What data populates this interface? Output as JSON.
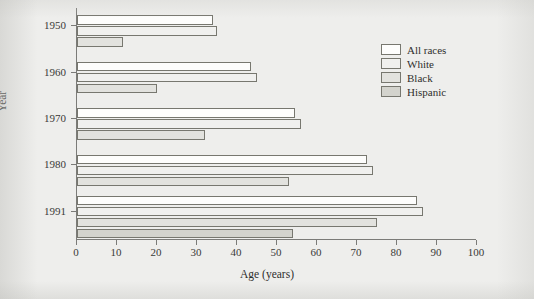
{
  "chart_data": {
    "type": "bar",
    "orientation": "horizontal",
    "title": "",
    "xlabel": "Age (years)",
    "ylabel": "Year",
    "xlim": [
      0,
      100
    ],
    "xticks": [
      0,
      10,
      20,
      30,
      40,
      50,
      60,
      70,
      80,
      90,
      100
    ],
    "xticklabels": [
      "0",
      "10",
      "20",
      "30",
      "40",
      "50",
      "60",
      "70",
      "80",
      "90",
      "100"
    ],
    "categories": [
      "1950",
      "1960",
      "1970",
      "1980",
      "1991"
    ],
    "yticklabels": [
      "1950",
      "1960",
      "1970",
      "1980",
      "1991"
    ],
    "grid": false,
    "legend_position": "upper right",
    "series": [
      {
        "name": "All races",
        "color": "#fdfdfc",
        "values": [
          34,
          43.5,
          54.5,
          72.5,
          85
        ]
      },
      {
        "name": "White",
        "color": "#f0f0ee",
        "values": [
          35,
          45,
          56,
          74,
          86.5
        ]
      },
      {
        "name": "Black",
        "color": "#e2e2de",
        "values": [
          11.5,
          20,
          32,
          53,
          75
        ]
      },
      {
        "name": "Hispanic",
        "color": "#d3d3cd",
        "values": [
          null,
          null,
          null,
          null,
          54
        ]
      }
    ]
  },
  "legend": {
    "items": [
      {
        "label": "All races",
        "swatch": "legend-swatch-all-races"
      },
      {
        "label": "White",
        "swatch": "legend-swatch-white"
      },
      {
        "label": "Black",
        "swatch": "legend-swatch-black"
      },
      {
        "label": "Hispanic",
        "swatch": "legend-swatch-hispanic"
      }
    ]
  }
}
